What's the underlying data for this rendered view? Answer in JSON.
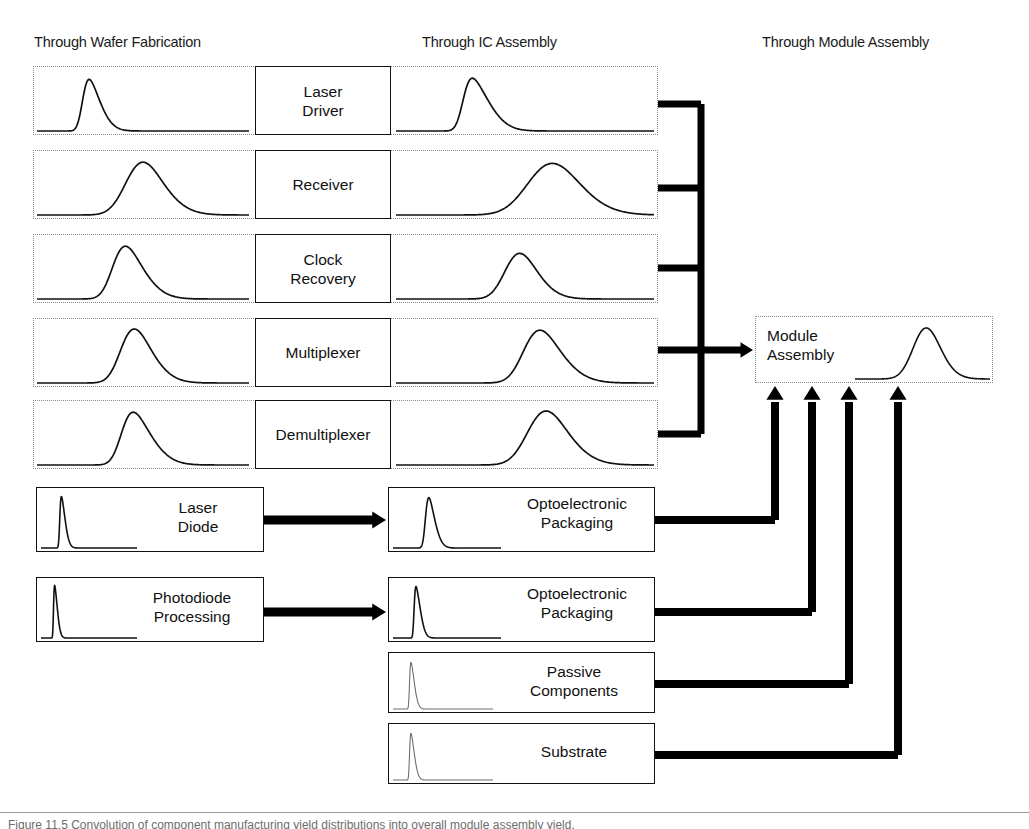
{
  "figure": {
    "columns": [
      {
        "id": "wafer",
        "label": "Through Wafer Fabrication",
        "x": 34,
        "y": 34
      },
      {
        "id": "ic",
        "label": "Through IC Assembly",
        "x": 422,
        "y": 34
      },
      {
        "id": "module",
        "label": "Through Module Assembly",
        "x": 762,
        "y": 34
      }
    ],
    "colors": {
      "ink": "#1a1a1a",
      "curve": "#111111",
      "wire": "#000000",
      "dotted_border": "#8a8a8a",
      "solid_border": "#111111",
      "background": "#ffffff",
      "faint_curve": "#6f6f6f"
    },
    "ic_rows": [
      {
        "id": "laser-driver",
        "label": "Laser\nDriver",
        "row": {
          "x": 33,
          "y": 66,
          "w": 625,
          "h": 69
        },
        "label_box": {
          "x": 255,
          "y": 66,
          "w": 136,
          "h": 69
        },
        "wafer_curve": {
          "x": 37,
          "y": 69,
          "w": 212,
          "h": 63,
          "peak": 0.215,
          "sigma": 0.068,
          "amp": 0.86,
          "skew": 0.55,
          "weight": 1.7
        },
        "ic_curve": {
          "x": 396,
          "y": 69,
          "w": 258,
          "h": 63,
          "peak": 0.26,
          "sigma": 0.082,
          "amp": 0.88,
          "skew": 0.6,
          "weight": 1.7
        }
      },
      {
        "id": "receiver",
        "label": "Receiver",
        "row": {
          "x": 33,
          "y": 150,
          "w": 625,
          "h": 69
        },
        "label_box": {
          "x": 255,
          "y": 150,
          "w": 136,
          "h": 69
        },
        "wafer_curve": {
          "x": 37,
          "y": 153,
          "w": 212,
          "h": 63,
          "peak": 0.43,
          "sigma": 0.13,
          "amp": 0.88,
          "skew": 0.3,
          "weight": 1.7
        },
        "ic_curve": {
          "x": 396,
          "y": 153,
          "w": 258,
          "h": 63,
          "peak": 0.53,
          "sigma": 0.14,
          "amp": 0.86,
          "skew": 0.25,
          "weight": 1.7
        }
      },
      {
        "id": "clock-recovery",
        "label": "Clock\nRecovery",
        "row": {
          "x": 33,
          "y": 234,
          "w": 625,
          "h": 69
        },
        "label_box": {
          "x": 255,
          "y": 234,
          "w": 136,
          "h": 69
        },
        "wafer_curve": {
          "x": 37,
          "y": 237,
          "w": 212,
          "h": 63,
          "peak": 0.36,
          "sigma": 0.112,
          "amp": 0.88,
          "skew": 0.4,
          "weight": 1.7
        },
        "ic_curve": {
          "x": 396,
          "y": 237,
          "w": 258,
          "h": 63,
          "peak": 0.43,
          "sigma": 0.092,
          "amp": 0.76,
          "skew": 0.3,
          "weight": 1.7
        }
      },
      {
        "id": "multiplexer",
        "label": "Multiplexer",
        "row": {
          "x": 33,
          "y": 318,
          "w": 625,
          "h": 69
        },
        "label_box": {
          "x": 255,
          "y": 318,
          "w": 136,
          "h": 69
        },
        "wafer_curve": {
          "x": 37,
          "y": 321,
          "w": 212,
          "h": 63,
          "peak": 0.4,
          "sigma": 0.112,
          "amp": 0.9,
          "skew": 0.35,
          "weight": 1.7
        },
        "ic_curve": {
          "x": 396,
          "y": 321,
          "w": 258,
          "h": 63,
          "peak": 0.5,
          "sigma": 0.11,
          "amp": 0.88,
          "skew": 0.35,
          "weight": 1.7
        }
      },
      {
        "id": "demultiplexer",
        "label": "Demultiplexer",
        "row": {
          "x": 33,
          "y": 400,
          "w": 625,
          "h": 69
        },
        "label_box": {
          "x": 255,
          "y": 400,
          "w": 136,
          "h": 69
        },
        "wafer_curve": {
          "x": 37,
          "y": 403,
          "w": 212,
          "h": 63,
          "peak": 0.4,
          "sigma": 0.11,
          "amp": 0.88,
          "skew": 0.45,
          "weight": 1.7
        },
        "ic_curve": {
          "x": 396,
          "y": 403,
          "w": 258,
          "h": 63,
          "peak": 0.52,
          "sigma": 0.115,
          "amp": 0.9,
          "skew": 0.3,
          "weight": 1.7
        }
      }
    ],
    "left_components": [
      {
        "id": "laser-diode",
        "label": "Laser\nDiode",
        "box": {
          "x": 36,
          "y": 487,
          "w": 228,
          "h": 65
        },
        "curve": {
          "x": 41,
          "y": 490,
          "w": 96,
          "h": 59,
          "peak": 0.195,
          "sigma": 0.048,
          "amp": 0.92,
          "skew": 0.85,
          "weight": 1.6
        },
        "label_pos": {
          "x": 140,
          "y": 498,
          "w": 116
        }
      },
      {
        "id": "photodiode-processing",
        "label": "Photodiode\nProcessing",
        "box": {
          "x": 36,
          "y": 577,
          "w": 228,
          "h": 65
        },
        "curve": {
          "x": 41,
          "y": 580,
          "w": 96,
          "h": 59,
          "peak": 0.13,
          "sigma": 0.035,
          "amp": 0.94,
          "skew": 0.95,
          "weight": 1.6
        },
        "label_pos": {
          "x": 126,
          "y": 588,
          "w": 132
        }
      }
    ],
    "right_components": [
      {
        "id": "optoelectronic-packaging-laser",
        "label": "Optoelectronic\nPackaging",
        "box": {
          "x": 388,
          "y": 487,
          "w": 267,
          "h": 65
        },
        "curve": {
          "x": 393,
          "y": 490,
          "w": 108,
          "h": 59,
          "peak": 0.3,
          "sigma": 0.072,
          "amp": 0.9,
          "skew": 0.6,
          "weight": 1.6
        },
        "label_pos": {
          "x": 503,
          "y": 494,
          "w": 148
        },
        "faint": false
      },
      {
        "id": "optoelectronic-packaging-photodiode",
        "label": "Optoelectronic\nPackaging",
        "box": {
          "x": 388,
          "y": 577,
          "w": 267,
          "h": 65
        },
        "curve": {
          "x": 393,
          "y": 580,
          "w": 108,
          "h": 59,
          "peak": 0.195,
          "sigma": 0.05,
          "amp": 0.92,
          "skew": 0.9,
          "weight": 1.6
        },
        "label_pos": {
          "x": 503,
          "y": 584,
          "w": 148
        },
        "faint": false
      },
      {
        "id": "passive-components",
        "label": "Passive\nComponents",
        "box": {
          "x": 388,
          "y": 652,
          "w": 267,
          "h": 61
        },
        "curve": {
          "x": 393,
          "y": 655,
          "w": 100,
          "h": 55,
          "peak": 0.165,
          "sigma": 0.042,
          "amp": 0.9,
          "skew": 0.95,
          "weight": 1.1
        },
        "label_pos": {
          "x": 498,
          "y": 662,
          "w": 152
        },
        "faint": true
      },
      {
        "id": "substrate",
        "label": "Substrate",
        "box": {
          "x": 388,
          "y": 723,
          "w": 267,
          "h": 61
        },
        "curve": {
          "x": 393,
          "y": 726,
          "w": 100,
          "h": 55,
          "peak": 0.165,
          "sigma": 0.042,
          "amp": 0.9,
          "skew": 0.95,
          "weight": 1.1
        },
        "label_pos": {
          "x": 498,
          "y": 742,
          "w": 152
        },
        "faint": true
      }
    ],
    "module": {
      "id": "module-assembly",
      "label": "Module\nAssembly",
      "box": {
        "x": 755,
        "y": 316,
        "w": 238,
        "h": 67
      },
      "label_pos": {
        "x": 767,
        "y": 326,
        "w": 110
      },
      "curve": {
        "x": 855,
        "y": 319,
        "w": 135,
        "h": 61,
        "peak": 0.455,
        "sigma": 0.135,
        "amp": 0.88,
        "skew": 0.22,
        "weight": 1.6
      }
    },
    "ic_bus": {
      "trunk_x": 701,
      "trunk_top": 104,
      "trunk_bottom": 434,
      "stub_left": 654,
      "arrow_y": 350,
      "arrow_tip_x": 753,
      "stub_ys": [
        104,
        188,
        268,
        350,
        434
      ],
      "thickness": 7
    },
    "module_feeds": [
      {
        "id": "feed-optoelectronic-laser",
        "from_y": 520,
        "turn_x": 775,
        "stub_left": 655,
        "top_y": 386
      },
      {
        "id": "feed-optoelectronic-photodiode",
        "from_y": 612,
        "turn_x": 812,
        "stub_left": 655,
        "top_y": 386
      },
      {
        "id": "feed-passive-components",
        "from_y": 684,
        "turn_x": 849,
        "stub_left": 655,
        "top_y": 386
      },
      {
        "id": "feed-substrate",
        "from_y": 755,
        "turn_x": 898,
        "stub_left": 655,
        "top_y": 386
      }
    ],
    "left_feeds": [
      {
        "id": "feed-laser-diode-to-packaging",
        "y": 520,
        "from_x": 264,
        "to_x": 386
      },
      {
        "id": "feed-photodiode-to-packaging",
        "y": 612,
        "from_x": 264,
        "to_x": 386
      }
    ],
    "footer": {
      "caption": "Figure 11.5  Convolution of component manufacturing yield distributions into overall module assembly yield."
    }
  }
}
